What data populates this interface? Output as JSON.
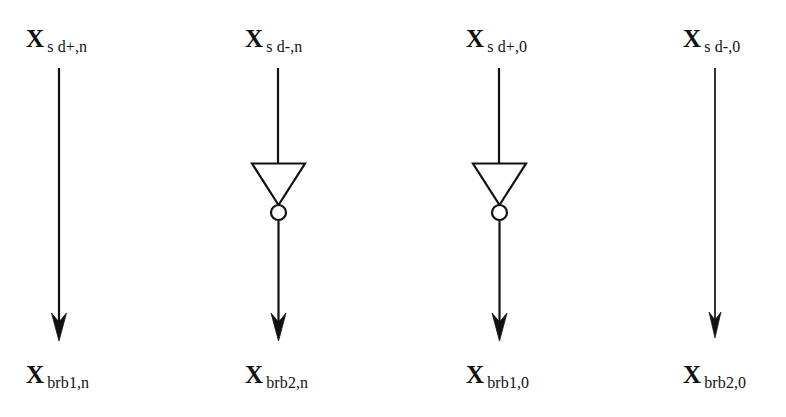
{
  "diagram": {
    "background_color": "#ffffff",
    "line_color": "#111111",
    "canvas": {
      "width": 786,
      "height": 417
    },
    "columns": [
      {
        "id": "col-1",
        "gate": "none",
        "top_label": {
          "base": "X",
          "sub": "s d+,n"
        },
        "bottom_label": {
          "base": "X",
          "sub": "brb1,n"
        }
      },
      {
        "id": "col-2",
        "gate": "inverter",
        "top_label": {
          "base": "X",
          "sub": "s d-,n"
        },
        "bottom_label": {
          "base": "X",
          "sub": "brb2,n"
        }
      },
      {
        "id": "col-3",
        "gate": "inverter",
        "top_label": {
          "base": "X",
          "sub": "s d+,0"
        },
        "bottom_label": {
          "base": "X",
          "sub": "brb1,0"
        }
      },
      {
        "id": "col-4",
        "gate": "none",
        "top_label": {
          "base": "X",
          "sub": "s d-,0"
        },
        "bottom_label": {
          "base": "X",
          "sub": "brb2,0"
        }
      }
    ]
  }
}
